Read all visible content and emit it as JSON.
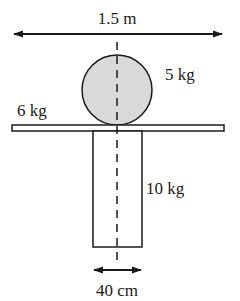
{
  "diagram": {
    "type": "physics-statics",
    "colors": {
      "stroke": "#1a1a1a",
      "ball_fill": "#d9d9d9",
      "background": "#ffffff"
    },
    "labels": {
      "top_width": "1.5 m",
      "ball_mass": "5 kg",
      "plank_mass": "6 kg",
      "column_mass": "10 kg",
      "column_width": "40 cm"
    },
    "elements": [
      {
        "name": "plank",
        "mass": "6 kg",
        "length": "1.5 m"
      },
      {
        "name": "ball",
        "mass": "5 kg",
        "shape": "circle"
      },
      {
        "name": "column",
        "mass": "10 kg",
        "width": "40 cm"
      },
      {
        "name": "center-line",
        "style": "dashed"
      }
    ]
  }
}
